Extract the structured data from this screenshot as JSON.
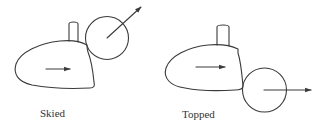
{
  "diagram": {
    "stroke_color": "#3a3a3a",
    "panels": [
      {
        "id": "skied",
        "label": "Skied",
        "ball_direction": "up-right",
        "club_motion": "right"
      },
      {
        "id": "topped",
        "label": "Topped",
        "ball_direction": "right",
        "club_motion": "right"
      }
    ]
  }
}
